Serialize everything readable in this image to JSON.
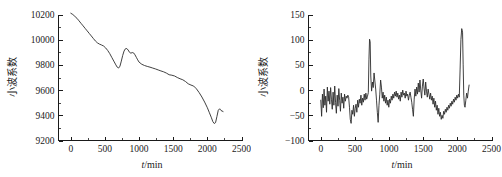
{
  "figure": {
    "background": "#ffffff",
    "ink": "#1a1a1a",
    "curve_color": "#2b2b2b"
  },
  "chart_data": [
    {
      "id": "left",
      "type": "line",
      "title": "",
      "xlabel": "t/min",
      "ylabel": "小波系数",
      "xlim": [
        -180,
        2500
      ],
      "ylim": [
        9200,
        10200
      ],
      "xticks": [
        0,
        500,
        1000,
        1500,
        2000,
        2500
      ],
      "xtick_labels": [
        "0",
        "500",
        "1000",
        "1500",
        "2000",
        "2500"
      ],
      "yticks": [
        9200,
        9400,
        9600,
        9800,
        10000,
        10200
      ],
      "ytick_labels": [
        "9200",
        "9400",
        "9600",
        "9800",
        "10000",
        "10200"
      ],
      "minor_ticks": true,
      "grid": false,
      "legend": null,
      "x": [
        0,
        30,
        60,
        90,
        120,
        150,
        180,
        210,
        240,
        270,
        300,
        330,
        360,
        390,
        420,
        450,
        480,
        510,
        540,
        570,
        600,
        630,
        660,
        680,
        700,
        720,
        740,
        760,
        780,
        800,
        820,
        840,
        860,
        880,
        900,
        920,
        940,
        960,
        980,
        1000,
        1040,
        1080,
        1120,
        1160,
        1200,
        1240,
        1280,
        1320,
        1360,
        1400,
        1440,
        1480,
        1520,
        1560,
        1600,
        1640,
        1680,
        1720,
        1760,
        1800,
        1840,
        1880,
        1920,
        1960,
        2000,
        2030,
        2060,
        2080,
        2100,
        2120,
        2140,
        2160,
        2180,
        2200,
        2230
      ],
      "y": [
        10210,
        10200,
        10185,
        10170,
        10150,
        10130,
        10110,
        10090,
        10070,
        10050,
        10030,
        10010,
        9990,
        9975,
        9965,
        9958,
        9950,
        9935,
        9915,
        9890,
        9860,
        9830,
        9800,
        9782,
        9775,
        9790,
        9830,
        9875,
        9910,
        9928,
        9930,
        9918,
        9900,
        9893,
        9898,
        9895,
        9880,
        9860,
        9840,
        9822,
        9805,
        9795,
        9788,
        9782,
        9775,
        9768,
        9760,
        9752,
        9745,
        9735,
        9722,
        9718,
        9712,
        9700,
        9690,
        9682,
        9668,
        9650,
        9640,
        9632,
        9610,
        9580,
        9545,
        9505,
        9460,
        9420,
        9380,
        9350,
        9335,
        9342,
        9390,
        9440,
        9452,
        9438,
        9430
      ]
    },
    {
      "id": "right",
      "type": "line",
      "title": "",
      "xlabel": "t/min",
      "ylabel": "小波系数",
      "xlim": [
        -180,
        2500
      ],
      "ylim": [
        -100,
        150
      ],
      "xticks": [
        0,
        500,
        1000,
        1500,
        2000,
        2500
      ],
      "xtick_labels": [
        "0",
        "500",
        "1000",
        "1500",
        "2000",
        "2500"
      ],
      "yticks": [
        -100,
        -50,
        0,
        50,
        100,
        150
      ],
      "ytick_labels": [
        "−100",
        "−50",
        "0",
        "50",
        "100",
        "150"
      ],
      "minor_ticks": true,
      "grid": false,
      "legend": null,
      "x": [
        0,
        12,
        24,
        36,
        48,
        60,
        72,
        84,
        96,
        108,
        120,
        132,
        144,
        156,
        168,
        180,
        192,
        204,
        216,
        228,
        240,
        252,
        264,
        276,
        288,
        300,
        312,
        324,
        336,
        348,
        360,
        372,
        384,
        396,
        408,
        420,
        432,
        444,
        456,
        468,
        480,
        492,
        504,
        516,
        528,
        540,
        552,
        564,
        576,
        588,
        600,
        612,
        624,
        636,
        648,
        660,
        672,
        684,
        696,
        705,
        714,
        723,
        732,
        744,
        756,
        768,
        780,
        792,
        804,
        816,
        828,
        840,
        852,
        864,
        876,
        888,
        900,
        912,
        924,
        936,
        948,
        960,
        972,
        984,
        996,
        1008,
        1020,
        1032,
        1044,
        1056,
        1068,
        1080,
        1092,
        1104,
        1116,
        1128,
        1140,
        1152,
        1164,
        1176,
        1188,
        1200,
        1212,
        1224,
        1236,
        1248,
        1260,
        1272,
        1284,
        1296,
        1308,
        1320,
        1332,
        1344,
        1356,
        1368,
        1380,
        1392,
        1404,
        1416,
        1428,
        1440,
        1452,
        1464,
        1476,
        1488,
        1500,
        1512,
        1524,
        1536,
        1548,
        1560,
        1572,
        1584,
        1596,
        1608,
        1620,
        1632,
        1644,
        1656,
        1668,
        1680,
        1692,
        1704,
        1716,
        1728,
        1740,
        1752,
        1764,
        1776,
        1788,
        1800,
        1812,
        1824,
        1836,
        1848,
        1860,
        1872,
        1884,
        1896,
        1908,
        1920,
        1932,
        1944,
        1956,
        1968,
        1980,
        1992,
        2004,
        2016,
        2028,
        2040,
        2052,
        2064,
        2076,
        2085,
        2094,
        2103,
        2112,
        2124,
        2136,
        2148,
        2160,
        2172,
        2184,
        2196,
        2208,
        2220,
        2232
      ],
      "y": [
        -20,
        -52,
        -8,
        -35,
        2,
        -30,
        -12,
        -44,
        6,
        -22,
        -2,
        -28,
        5,
        -18,
        -38,
        -4,
        -30,
        8,
        -24,
        -46,
        -10,
        -32,
        3,
        -20,
        -42,
        -6,
        -26,
        -14,
        -36,
        -8,
        -22,
        -12,
        -16,
        -10,
        -14,
        -34,
        -58,
        -66,
        -40,
        -48,
        -30,
        -52,
        -36,
        -28,
        -44,
        -20,
        -34,
        -18,
        -26,
        -10,
        -30,
        -16,
        -24,
        -8,
        -20,
        -6,
        -18,
        -12,
        -5,
        60,
        101,
        96,
        28,
        -2,
        16,
        5,
        34,
        18,
        2,
        -20,
        -44,
        -64,
        -30,
        -8,
        20,
        6,
        -16,
        -4,
        -22,
        -10,
        -26,
        -14,
        -30,
        -20,
        -34,
        -18,
        -26,
        -12,
        -20,
        -8,
        -16,
        -4,
        -12,
        -2,
        -14,
        -6,
        -18,
        -10,
        -22,
        -4,
        -14,
        0,
        -10,
        -6,
        -16,
        -2,
        -12,
        -8,
        -20,
        -10,
        -4,
        -14,
        -24,
        -38,
        -52,
        -18,
        2,
        -12,
        6,
        -8,
        14,
        -4,
        20,
        0,
        -16,
        8,
        22,
        4,
        -10,
        16,
        -2,
        -14,
        2,
        -8,
        -18,
        -6,
        -20,
        -12,
        -28,
        -16,
        -34,
        -22,
        -40,
        -30,
        -48,
        -36,
        -52,
        -44,
        -58,
        -50,
        -56,
        -42,
        -48,
        -38,
        -44,
        -34,
        -40,
        -30,
        -36,
        -26,
        -32,
        -22,
        -28,
        -18,
        -24,
        -14,
        -20,
        -10,
        -16,
        -8,
        -14,
        40,
        100,
        122,
        115,
        50,
        -10,
        -30,
        -34,
        -20,
        -6,
        -16,
        -2,
        10
      ]
    }
  ]
}
